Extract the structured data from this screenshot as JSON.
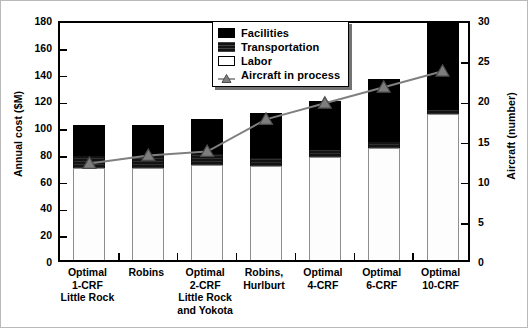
{
  "chart_data": {
    "type": "bar",
    "subtype": "stacked-bar-with-line-overlay",
    "title": "",
    "categories": [
      "Optimal 1-CRF Little Rock",
      "Robins",
      "Optimal 2-CRF Little Rock and Yokota",
      "Robins, Hurlburt",
      "Optimal 4-CRF",
      "Optimal 6-CRF",
      "Optimal 10-CRF"
    ],
    "category_lines": [
      [
        "Optimal",
        "1-CRF",
        "Little Rock"
      ],
      [
        "Robins"
      ],
      [
        "Optimal",
        "2-CRF",
        "Little Rock",
        "and Yokota"
      ],
      [
        "Robins,",
        "Hurlburt"
      ],
      [
        "Optimal",
        "4-CRF"
      ],
      [
        "Optimal",
        "6-CRF"
      ],
      [
        "Optimal",
        "10-CRF"
      ]
    ],
    "series": [
      {
        "name": "Labor",
        "values": [
          69,
          69,
          71,
          70,
          77,
          84,
          109
        ],
        "color": "#ffffff"
      },
      {
        "name": "Transportation",
        "values": [
          9,
          9,
          8,
          6,
          5,
          4,
          3
        ],
        "color": "#131313"
      },
      {
        "name": "Facilities",
        "values": [
          23,
          23,
          26,
          34,
          37,
          47,
          65
        ],
        "color": "#000000"
      }
    ],
    "stack_order_bottom_to_top": [
      "Labor",
      "Transportation",
      "Facilities"
    ],
    "totals": [
      101,
      101,
      105,
      110,
      119,
      135,
      177
    ],
    "line_series": {
      "name": "Aircraft in process",
      "values": [
        12.5,
        13.5,
        14,
        18,
        20,
        22,
        24
      ],
      "color": "#808080",
      "marker": "triangle",
      "axis": "right"
    },
    "xlabel": "",
    "ylabel": "Annual cost ($M)",
    "ylabel_right": "Aircraft (number)",
    "ylim": [
      0,
      180
    ],
    "yticks": [
      0,
      20,
      40,
      60,
      80,
      100,
      120,
      140,
      160,
      180
    ],
    "ylim_right": [
      0,
      30
    ],
    "yticks_right": [
      0,
      5,
      10,
      15,
      20,
      25,
      30
    ],
    "grid": false,
    "legend_position": "top-center"
  },
  "axes": {
    "left_title": "Annual cost ($M)",
    "right_title": "Aircraft (number)",
    "left_ticks": [
      "180",
      "160",
      "140",
      "120",
      "100",
      "80",
      "60",
      "40",
      "20",
      "0"
    ],
    "right_ticks": [
      "30",
      "25",
      "20",
      "15",
      "10",
      "5",
      "0"
    ]
  },
  "legend": {
    "items": [
      {
        "label": "Facilities",
        "swatch": "facilities-swatch"
      },
      {
        "label": "Transportation",
        "swatch": "transportation-swatch"
      },
      {
        "label": "Labor",
        "swatch": "labor-swatch"
      },
      {
        "label": "Aircraft in process",
        "swatch": "aircraft-marker-swatch"
      }
    ]
  }
}
